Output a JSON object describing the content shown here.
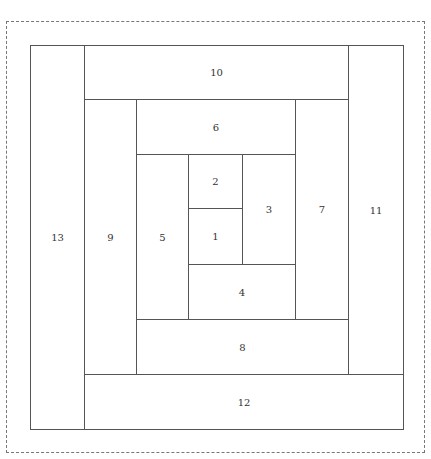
{
  "diagram": {
    "type": "log-cabin-quilt-block",
    "panels": [
      {
        "id": "p1",
        "label": "1"
      },
      {
        "id": "p2",
        "label": "2"
      },
      {
        "id": "p3",
        "label": "3"
      },
      {
        "id": "p4",
        "label": "4"
      },
      {
        "id": "p5",
        "label": "5"
      },
      {
        "id": "p6",
        "label": "6"
      },
      {
        "id": "p7",
        "label": "7"
      },
      {
        "id": "p8",
        "label": "8"
      },
      {
        "id": "p9",
        "label": "9"
      },
      {
        "id": "p10",
        "label": "10"
      },
      {
        "id": "p11",
        "label": "11"
      },
      {
        "id": "p12",
        "label": "12"
      },
      {
        "id": "p13",
        "label": "13"
      }
    ]
  }
}
